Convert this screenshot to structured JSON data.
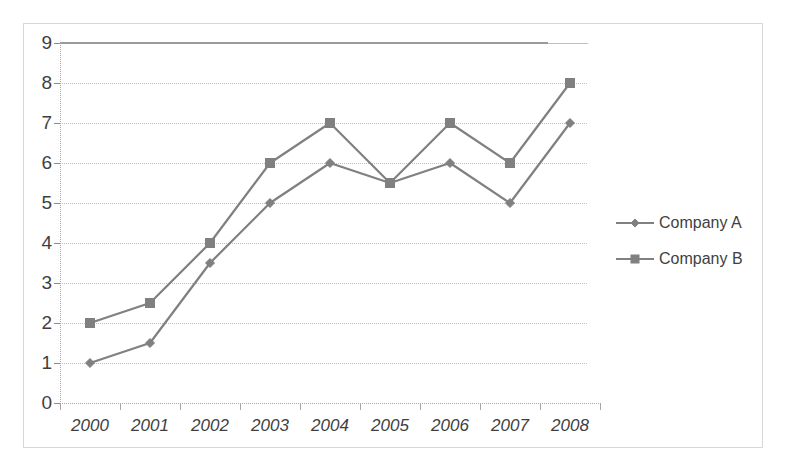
{
  "chart_data": {
    "type": "line",
    "title": "",
    "subtitle": "",
    "xlabel": "",
    "ylabel": "",
    "categories": [
      "2000",
      "2001",
      "2002",
      "2003",
      "2004",
      "2005",
      "2006",
      "2007",
      "2008"
    ],
    "series": [
      {
        "name": "Company A",
        "marker": "diamond",
        "color": "#808080",
        "values": [
          1,
          1.5,
          3.5,
          5,
          6,
          5.5,
          6,
          5,
          7
        ]
      },
      {
        "name": "Company B",
        "marker": "square",
        "color": "#808080",
        "values": [
          2,
          2.5,
          4,
          6,
          7,
          5.5,
          7,
          6,
          8
        ]
      }
    ],
    "ylim": [
      0,
      9
    ],
    "yticks": [
      0,
      1,
      2,
      3,
      4,
      5,
      6,
      7,
      8,
      9
    ],
    "ytick_labels": [
      "0",
      "1",
      "2",
      "3",
      "4",
      "5",
      "6",
      "7",
      "8",
      "9"
    ],
    "grid": true,
    "grid_axis": "y",
    "legend": [
      "Company A",
      "Company B"
    ],
    "legend_position": "right"
  },
  "axes": {
    "y_axis_line_color": "#a6a6a6",
    "x_axis_line_color": "#a6a6a6",
    "gridline_color": "#bfbfbf"
  },
  "frame": {
    "border_color": "#d8d8d8",
    "background": "#ffffff"
  }
}
